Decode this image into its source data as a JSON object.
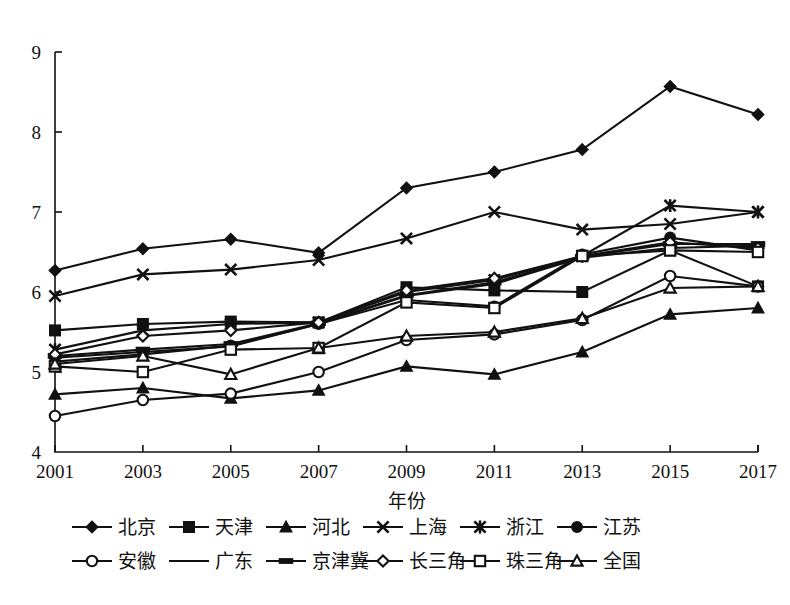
{
  "chart_data": {
    "type": "line",
    "title": "",
    "xlabel": "年份",
    "ylabel": "",
    "grid": false,
    "legend_position": "bottom",
    "x": [
      2001,
      2003,
      2005,
      2007,
      2009,
      2011,
      2013,
      2015,
      2017
    ],
    "xtick_labels": [
      "2001",
      "2003",
      "2005",
      "2007",
      "2009",
      "2011",
      "2013",
      "2015",
      "2017"
    ],
    "ytick_labels": [
      "4",
      "5",
      "6",
      "7",
      "8",
      "9"
    ],
    "ylim": [
      4,
      9
    ],
    "xlim": [
      2001,
      2017
    ],
    "series": [
      {
        "name": "北京",
        "marker": "filled-diamond",
        "values": [
          6.27,
          6.54,
          6.66,
          6.49,
          7.3,
          7.5,
          7.78,
          8.57,
          8.22
        ]
      },
      {
        "name": "天津",
        "marker": "filled-square",
        "values": [
          5.52,
          5.6,
          5.63,
          5.62,
          6.06,
          6.02,
          6.0,
          6.52,
          6.07
        ]
      },
      {
        "name": "河北",
        "marker": "filled-triangle",
        "values": [
          4.72,
          4.8,
          4.67,
          4.77,
          5.07,
          4.97,
          5.25,
          5.72,
          5.8
        ]
      },
      {
        "name": "上海",
        "marker": "cross-x",
        "values": [
          5.95,
          6.22,
          6.28,
          6.4,
          6.67,
          7.0,
          6.78,
          6.85,
          7.0
        ]
      },
      {
        "name": "浙江",
        "marker": "asterisk",
        "values": [
          5.28,
          5.52,
          5.6,
          5.62,
          6.0,
          6.15,
          6.45,
          7.08,
          7.0
        ]
      },
      {
        "name": "江苏",
        "marker": "filled-circle",
        "values": [
          5.13,
          5.22,
          5.33,
          5.6,
          5.9,
          5.82,
          6.47,
          6.68,
          6.52
        ]
      },
      {
        "name": "安徽",
        "marker": "open-circle",
        "values": [
          4.45,
          4.65,
          4.73,
          5.0,
          5.4,
          5.47,
          5.65,
          6.2,
          6.07
        ]
      },
      {
        "name": "广东",
        "marker": "none",
        "values": [
          5.18,
          5.25,
          5.32,
          5.6,
          5.95,
          6.1,
          6.43,
          6.55,
          6.58
        ]
      },
      {
        "name": "京津冀",
        "marker": "h-bar",
        "values": [
          5.2,
          5.28,
          5.35,
          5.61,
          5.96,
          6.12,
          6.44,
          6.6,
          6.6
        ]
      },
      {
        "name": "长三角",
        "marker": "open-diamond",
        "values": [
          5.22,
          5.45,
          5.52,
          5.62,
          6.02,
          6.17,
          6.45,
          6.62,
          6.55
        ]
      },
      {
        "name": "珠三角",
        "marker": "open-square",
        "values": [
          5.07,
          5.0,
          5.28,
          5.3,
          5.87,
          5.8,
          6.45,
          6.52,
          6.5
        ]
      },
      {
        "name": "全国",
        "marker": "open-triangle",
        "values": [
          5.1,
          5.2,
          4.97,
          5.3,
          5.45,
          5.5,
          5.67,
          6.05,
          6.07
        ]
      }
    ]
  },
  "legend": {
    "rows": [
      [
        "北京",
        "天津",
        "河北",
        "上海",
        "浙江",
        "江苏"
      ],
      [
        "安徽",
        "广东",
        "京津冀",
        "长三角",
        "珠三角",
        "全国"
      ]
    ]
  },
  "colors": {
    "ink": "#111111",
    "background": "#ffffff"
  }
}
